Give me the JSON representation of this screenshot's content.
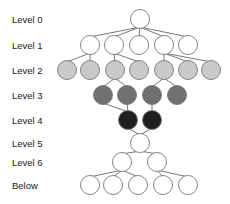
{
  "diagram": {
    "labels_x": 12,
    "levels": [
      {
        "id": "L0",
        "label": "Level 0",
        "y": 19,
        "fill": "#ffffff",
        "nodes_x": [
          140
        ]
      },
      {
        "id": "L1",
        "label": "Level 1",
        "y": 45,
        "fill": "#ffffff",
        "nodes_x": [
          90,
          114,
          139,
          164,
          188
        ]
      },
      {
        "id": "L2",
        "label": "Level 2",
        "y": 70,
        "fill": "#c9c9c9",
        "nodes_x": [
          67,
          90,
          115,
          139,
          164,
          188,
          211
        ]
      },
      {
        "id": "L3",
        "label": "Level 3",
        "y": 95,
        "fill": "#707070",
        "nodes_x": [
          103,
          127,
          152,
          177
        ]
      },
      {
        "id": "L4",
        "label": "Level 4",
        "y": 120,
        "fill": "#1f1f1f",
        "nodes_x": [
          128,
          152
        ]
      },
      {
        "id": "L5",
        "label": "Level 5",
        "y": 143,
        "fill": "#ffffff",
        "nodes_x": [
          140
        ]
      },
      {
        "id": "L6",
        "label": "Level 6",
        "y": 162,
        "fill": "#ffffff",
        "nodes_x": [
          122,
          157
        ]
      },
      {
        "id": "B",
        "label": "Below",
        "y": 185,
        "fill": "#ffffff",
        "nodes_x": [
          90,
          113,
          138,
          163,
          188
        ]
      }
    ],
    "node_radius": 9.5,
    "edges": [
      [
        "L0.0",
        "L1.0"
      ],
      [
        "L0.0",
        "L1.1"
      ],
      [
        "L0.0",
        "L1.2"
      ],
      [
        "L0.0",
        "L1.3"
      ],
      [
        "L0.0",
        "L1.4"
      ],
      [
        "L1.0",
        "L2.0"
      ],
      [
        "L1.0",
        "L2.1"
      ],
      [
        "L1.1",
        "L2.2"
      ],
      [
        "L1.1",
        "L2.3"
      ],
      [
        "L1.3",
        "L2.4"
      ],
      [
        "L1.3",
        "L2.5"
      ],
      [
        "L1.3",
        "L2.6"
      ],
      [
        "L2.2",
        "L3.0"
      ],
      [
        "L2.2",
        "L3.1"
      ],
      [
        "L2.4",
        "L3.2"
      ],
      [
        "L2.4",
        "L3.3"
      ],
      [
        "L3.0",
        "L4.0"
      ],
      [
        "L3.1",
        "L4.0"
      ],
      [
        "L3.2",
        "L4.1"
      ],
      [
        "L4.0",
        "L5.0"
      ],
      [
        "L4.1",
        "L5.0"
      ],
      [
        "L5.0",
        "L6.0"
      ],
      [
        "L5.0",
        "L6.1"
      ],
      [
        "L6.0",
        "B.0"
      ],
      [
        "L6.0",
        "B.1"
      ],
      [
        "L6.0",
        "B.2"
      ],
      [
        "L6.1",
        "B.3"
      ],
      [
        "L6.1",
        "B.4"
      ]
    ]
  }
}
